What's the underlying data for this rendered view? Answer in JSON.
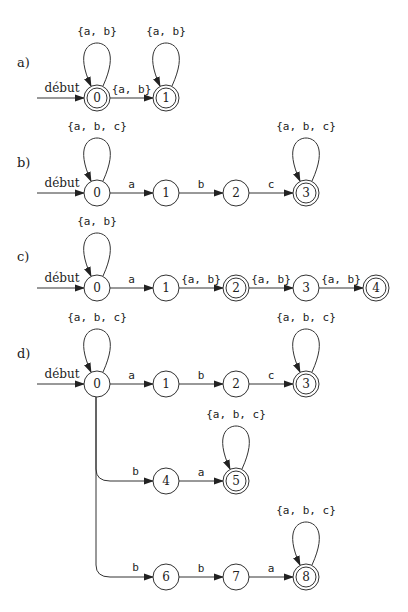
{
  "colors": {
    "stroke": "#333333",
    "text": "#222222",
    "background": "#ffffff"
  },
  "start_label": "début",
  "automata": [
    {
      "label": "a)",
      "label_pos": [
        17,
        67
      ],
      "start": {
        "from": [
          37,
          98
        ],
        "label_pos": [
          62,
          92
        ]
      },
      "states": [
        {
          "id": "0",
          "x": 97,
          "y": 98,
          "accepting": true,
          "loop": "{a, b}"
        },
        {
          "id": "1",
          "x": 166,
          "y": 98,
          "accepting": true,
          "loop": "{a, b}"
        }
      ],
      "transitions": [
        {
          "from": "0",
          "to": "1",
          "label": "{a, b}"
        }
      ]
    },
    {
      "label": "b)",
      "label_pos": [
        17,
        167
      ],
      "start": {
        "from": [
          37,
          193
        ],
        "label_pos": [
          62,
          187
        ]
      },
      "states": [
        {
          "id": "0",
          "x": 97,
          "y": 193,
          "accepting": false,
          "loop": "{a, b, c}"
        },
        {
          "id": "1",
          "x": 166,
          "y": 193,
          "accepting": false
        },
        {
          "id": "2",
          "x": 236,
          "y": 193,
          "accepting": false
        },
        {
          "id": "3",
          "x": 306,
          "y": 193,
          "accepting": true,
          "loop": "{a, b, c}"
        }
      ],
      "transitions": [
        {
          "from": "0",
          "to": "1",
          "label": "a"
        },
        {
          "from": "1",
          "to": "2",
          "label": "b"
        },
        {
          "from": "2",
          "to": "3",
          "label": "c"
        }
      ]
    },
    {
      "label": "c)",
      "label_pos": [
        17,
        261
      ],
      "start": {
        "from": [
          37,
          288
        ],
        "label_pos": [
          62,
          282
        ]
      },
      "states": [
        {
          "id": "0",
          "x": 97,
          "y": 288,
          "accepting": false,
          "loop": "{a, b}"
        },
        {
          "id": "1",
          "x": 166,
          "y": 288,
          "accepting": false
        },
        {
          "id": "2",
          "x": 236,
          "y": 288,
          "accepting": true
        },
        {
          "id": "3",
          "x": 306,
          "y": 288,
          "accepting": false
        },
        {
          "id": "4",
          "x": 376,
          "y": 288,
          "accepting": true
        }
      ],
      "transitions": [
        {
          "from": "0",
          "to": "1",
          "label": "a"
        },
        {
          "from": "1",
          "to": "2",
          "label": "{a, b}"
        },
        {
          "from": "2",
          "to": "3",
          "label": "{a, b}"
        },
        {
          "from": "3",
          "to": "4",
          "label": "{a, b}"
        }
      ]
    },
    {
      "label": "d)",
      "label_pos": [
        17,
        358
      ],
      "start": {
        "from": [
          37,
          384
        ],
        "label_pos": [
          62,
          378
        ]
      },
      "states": [
        {
          "id": "0",
          "x": 97,
          "y": 384,
          "accepting": false,
          "loop": "{a, b, c}"
        },
        {
          "id": "1",
          "x": 166,
          "y": 384,
          "accepting": false
        },
        {
          "id": "2",
          "x": 236,
          "y": 384,
          "accepting": false
        },
        {
          "id": "3",
          "x": 306,
          "y": 384,
          "accepting": true,
          "loop": "{a, b, c}"
        },
        {
          "id": "4",
          "x": 166,
          "y": 481,
          "accepting": false
        },
        {
          "id": "5",
          "x": 236,
          "y": 481,
          "accepting": true,
          "loop": "{a, b, c}"
        },
        {
          "id": "6",
          "x": 166,
          "y": 577,
          "accepting": false
        },
        {
          "id": "7",
          "x": 236,
          "y": 577,
          "accepting": false
        },
        {
          "id": "8",
          "x": 306,
          "y": 577,
          "accepting": true,
          "loop": "{a, b, c}"
        }
      ],
      "transitions": [
        {
          "from": "0",
          "to": "1",
          "label": "a"
        },
        {
          "from": "1",
          "to": "2",
          "label": "b"
        },
        {
          "from": "2",
          "to": "3",
          "label": "c"
        },
        {
          "from": "0",
          "to": "4",
          "label": "b",
          "branch": true
        },
        {
          "from": "4",
          "to": "5",
          "label": "a"
        },
        {
          "from": "0",
          "to": "6",
          "label": "b",
          "branch": true
        },
        {
          "from": "6",
          "to": "7",
          "label": "b"
        },
        {
          "from": "7",
          "to": "8",
          "label": "a"
        }
      ]
    }
  ]
}
